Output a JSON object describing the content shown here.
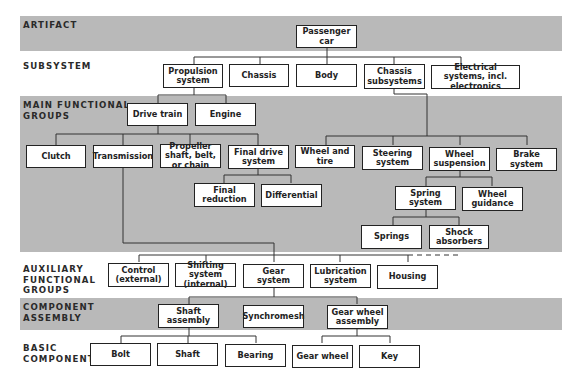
{
  "levels": {
    "artifact": "ARTIFACT",
    "subsystem": "SUBSYSTEM",
    "main_functional_groups": "MAIN FUNCTIONAL GROUPS",
    "auxiliary_functional_groups": "AUXILIARY FUNCTIONAL GROUPS",
    "component_assembly": "COMPONENT ASSEMBLY",
    "basic_component": "BASIC COMPONENT"
  },
  "nodes": {
    "passenger_car": "Passenger car",
    "propulsion_system": "Propulsion system",
    "chassis": "Chassis",
    "body": "Body",
    "chassis_subsystems": "Chassis subsystems",
    "electrical_systems": "Electrical systems, incl. electronics",
    "drive_train": "Drive train",
    "engine": "Engine",
    "clutch": "Clutch",
    "transmission": "Transmission",
    "propeller_shaft": "Propeller shaft, belt, or chain",
    "final_drive_system": "Final drive system",
    "final_reduction": "Final reduction",
    "differential": "Differential",
    "wheel_and_tire": "Wheel and tire",
    "steering_system": "Steering system",
    "wheel_suspension": "Wheel suspension",
    "brake_system": "Brake system",
    "spring_system": "Spring system",
    "wheel_guidance": "Wheel guidance",
    "springs": "Springs",
    "shock_absorbers": "Shock absorbers",
    "control_external": "Control (external)",
    "shifting_system": "Shifting system (internal)",
    "gear_system": "Gear system",
    "lubrication_system": "Lubrication system",
    "housing": "Housing",
    "shaft_assembly": "Shaft assembly",
    "synchromesh": "Synchromesh",
    "gear_wheel_assembly": "Gear wheel assembly",
    "bolt": "Bolt",
    "shaft": "Shaft",
    "bearing": "Bearing",
    "gear_wheel": "Gear wheel",
    "key": "Key"
  }
}
